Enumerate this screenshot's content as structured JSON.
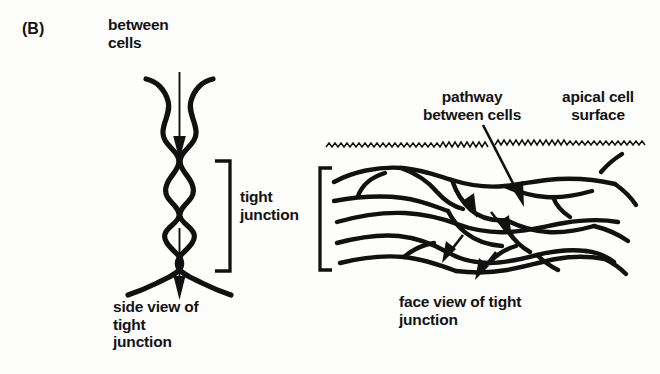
{
  "figure": {
    "panel_label": "(B)",
    "background_color": "#fdfdfc",
    "ink_color": "#111111"
  },
  "labels": {
    "between_cells": "between\ncells",
    "tight_junction": "tight\njunction",
    "side_view": "side view of\ntight\njunction",
    "pathway_between_cells": "pathway\nbetween cells",
    "apical_cell_surface": "apical cell\nsurface",
    "face_view": "face view of tight\njunction"
  },
  "diagrams": {
    "side_view": {
      "name": "side-view-of-tight-junction",
      "description": "Two plasma membranes of adjacent cells shown in cross section, flaring apart at top and bottom and crossing at four kiss points that seal the intercellular space.",
      "kiss_point_count": 4,
      "arrow_label": "paracellular pathway arrow pointing downward through the intercellular space"
    },
    "face_view": {
      "name": "face-view-of-tight-junction",
      "description": "Freeze-fracture face view showing a branching network of anastomosing sealing strands forming closed loops between two cells.",
      "arrow_count": 4,
      "arrow_label": "short arrows tracing a tortuous pathway through the strand network",
      "apical_surface_label": "zigzag microvillus line marking the apical cell surface"
    }
  },
  "brackets": {
    "side_view_bracket": "]",
    "face_view_bracket": "["
  }
}
